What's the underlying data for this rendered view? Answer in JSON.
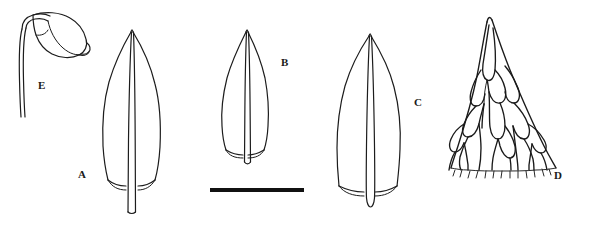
{
  "plate": {
    "title": "Botanical line-drawing plate",
    "background_color": "#ffffff",
    "ink_color": "#1c1c1c",
    "width": 592,
    "height": 225
  },
  "figures": [
    {
      "label": "A",
      "name": "leaf-a",
      "description": "Whole leaf, lanceolate, long-acuminate apex, excurrent costa projecting beyond leaf base",
      "label_x": 78,
      "label_y": 169
    },
    {
      "label": "B",
      "name": "leaf-b",
      "description": "Whole leaf, smaller, ovate-lanceolate with acuminate apex and excurrent costa",
      "label_x": 281,
      "label_y": 57
    },
    {
      "label": "C",
      "name": "leaf-c",
      "description": "Whole leaf, broadly lanceolate with rounded costa projection at base",
      "label_x": 414,
      "label_y": 97
    },
    {
      "label": "D",
      "name": "leaf-apex-cells-d",
      "description": "Leaf apex cell detail showing elongate cells and serrate margins",
      "label_x": 554,
      "label_y": 170
    },
    {
      "label": "E",
      "name": "capsule-seta-e",
      "description": "Inclined capsule with operculum borne on a curved seta",
      "label_x": 38,
      "label_y": 80
    }
  ],
  "scale_bar": {
    "name": "scale-bar",
    "x": 210,
    "y": 188,
    "width": 94,
    "height": 4,
    "color": "#111111"
  }
}
